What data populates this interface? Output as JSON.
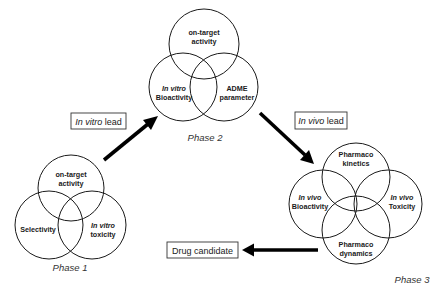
{
  "diagram": {
    "type": "drug discovery phase Venn flow",
    "phases": [
      {
        "label": "Phase 1",
        "circles": [
          {
            "lines": [
              "on-target",
              "activity"
            ],
            "italic": [
              false,
              false
            ]
          },
          {
            "lines": [
              "Selectivity"
            ],
            "italic": [
              false
            ]
          },
          {
            "lines": [
              "In vitro",
              "toxicity"
            ],
            "italic": [
              true,
              false
            ]
          }
        ]
      },
      {
        "label": "Phase 2",
        "circles": [
          {
            "lines": [
              "on-target",
              "activity"
            ],
            "italic": [
              false,
              false
            ]
          },
          {
            "lines": [
              "In vitro",
              "Bioactivity"
            ],
            "italic": [
              true,
              false
            ]
          },
          {
            "lines": [
              "ADME",
              "parameter"
            ],
            "italic": [
              false,
              false
            ]
          }
        ]
      },
      {
        "label": "Phase 3",
        "circles": [
          {
            "lines": [
              "Pharmaco",
              "kinetics"
            ],
            "italic": [
              false,
              false
            ]
          },
          {
            "lines": [
              "In vivo",
              "Bioactivity"
            ],
            "italic": [
              true,
              false
            ]
          },
          {
            "lines": [
              "In vivo",
              "Toxicity"
            ],
            "italic": [
              true,
              false
            ]
          },
          {
            "lines": [
              "Pharmaco",
              "dynamics"
            ],
            "italic": [
              false,
              false
            ]
          }
        ]
      }
    ],
    "transitions": [
      {
        "from": "Phase 1",
        "to": "Phase 2",
        "label_italic": "In vitro",
        "label_rest": " lead"
      },
      {
        "from": "Phase 2",
        "to": "Phase 3",
        "label_italic": "In vivo",
        "label_rest": " lead"
      },
      {
        "from": "Phase 3",
        "to": "output",
        "label_italic": "",
        "label_rest": "Drug candidate"
      }
    ],
    "colors": {
      "stroke": "#1a1a1a",
      "arrow": "#000000",
      "background": "#ffffff"
    }
  }
}
